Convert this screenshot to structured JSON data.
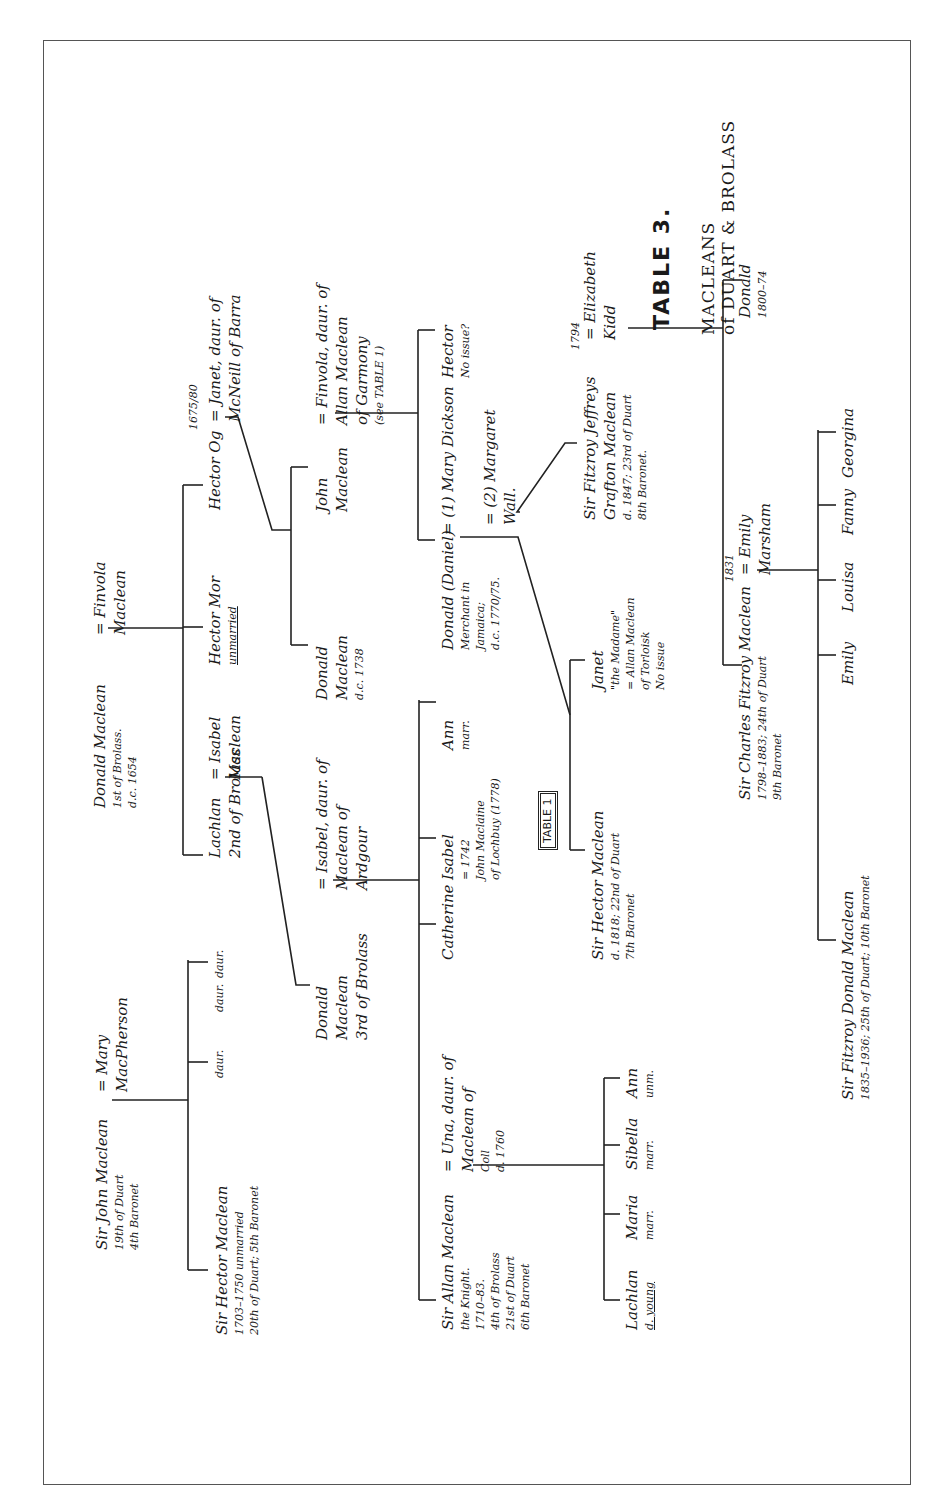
{
  "title": {
    "table_label": "TABLE 3.",
    "line1": "MACLEANS",
    "line2": "of DUART & BROLASS"
  },
  "people": {
    "sir_john": [
      "Sir John Maclean",
      "19th of Duart",
      "4th Baronet"
    ],
    "mary_macpherson": [
      "= Mary",
      "MacPherson"
    ],
    "sir_hector_1": [
      "Sir Hector Maclean",
      "1703–1750  unmarried",
      "20th of Duart; 5th Baronet"
    ],
    "daur_1": "daur.",
    "daur_2": "daur.",
    "daur_3": "daur.",
    "donald_1st": [
      "Donald Maclean",
      "1st of Brolass.",
      "d.c. 1654"
    ],
    "finvola_1": [
      "= Finvola",
      "Maclean"
    ],
    "lachlan_2nd": [
      "Lachlan",
      "2nd of Brolass"
    ],
    "isabel_maclean": [
      "= Isabel",
      "Maclean"
    ],
    "hector_mor": [
      "Hector Mor",
      "unmarried"
    ],
    "hector_og": [
      "Hector Og"
    ],
    "hector_og_date": "1675/80",
    "janet_mcneill": [
      "= Janet, daur. of",
      "McNeill of Barra"
    ],
    "donald_1738": [
      "Donald",
      "Maclean",
      "d.c. 1738"
    ],
    "john_maclean": [
      "John",
      "Maclean"
    ],
    "finvola_2": [
      "= Finvola, daur. of",
      "Allan Maclean",
      "of Garmony",
      "(see TABLE 1)"
    ],
    "donald_3rd": [
      "Donald",
      "Maclean",
      "3rd of Brolass"
    ],
    "isabel_ardgour": [
      "= Isabel, daur. of",
      "Maclean of",
      "Ardgour"
    ],
    "catherine": "Catherine",
    "isabel_2": [
      "Isabel",
      "= 1742",
      "John Maclaine",
      "of Lochbuy (1778)"
    ],
    "table1_ref": "TABLE 1",
    "ann_1": [
      "Ann",
      "marr."
    ],
    "donald_daniel": [
      "Donald (Daniel)",
      "Merchant in",
      "Jamaica;",
      "d.c. 1770/75."
    ],
    "mary_dickson": "= (1) Mary Dickson",
    "margaret_wall": [
      "= (2) Margaret",
      "Wall."
    ],
    "hector_no_issue": [
      "Hector",
      "No issue?"
    ],
    "sir_hector_22": [
      "Sir Hector Maclean",
      "d. 1818; 22nd of Duart",
      "7th Baronet"
    ],
    "janet_madame": [
      "Janet",
      "\"the Madame\"",
      "= Allan Maclean",
      "of Torloisk",
      "No issue"
    ],
    "sir_fitzroy_jeffreys": [
      "Sir Fitzroy Jeffreys",
      "Grafton Maclean",
      "d. 1847; 23rd of Duart",
      "8th Baronet."
    ],
    "fitzroy_marriage_year": "1794",
    "elizabeth_kidd": [
      "= Elizabeth",
      "Kidd"
    ],
    "donald_1800": [
      "Donald",
      "1800–74"
    ],
    "sir_allan": [
      "Sir Allan Maclean",
      "the Knight.",
      "1710–83.",
      "4th of Brolass",
      "21st of Duart",
      "6th Baronet"
    ],
    "una_coll": [
      "= Una, daur. of",
      "Maclean of",
      "Coll",
      "d. 1760"
    ],
    "lachlan_young": [
      "Lachlan",
      "d. young"
    ],
    "maria": [
      "Maria",
      "marr."
    ],
    "sibella": [
      "Sibella",
      "marr."
    ],
    "ann_2": [
      "Ann",
      "unm."
    ],
    "sir_charles": [
      "Sir Charles Fitzroy Maclean",
      "1798–1883; 24th of Duart",
      "9th Baronet"
    ],
    "charles_marriage_year": "1831",
    "emily_marsham": [
      "= Emily",
      "Marsham"
    ],
    "emily": "Emily",
    "louisa": "Louisa",
    "fanny": "Fanny",
    "georgina": "Georgina",
    "sir_fitzroy_donald": [
      "Sir Fitzroy Donald Maclean",
      "1835–1936; 25th of Duart; 10th Baronet"
    ]
  }
}
